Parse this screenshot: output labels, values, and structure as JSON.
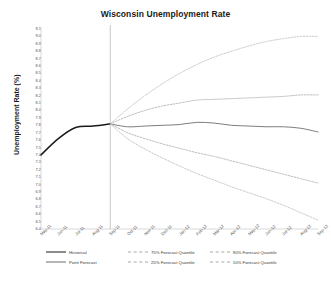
{
  "chart_data": {
    "type": "line",
    "title": "Wisconsin Unemployment Rate",
    "xlabel": "",
    "ylabel": "Unemployment Rate (%)",
    "ylim": [
      6.4,
      9.1
    ],
    "ytick_step": 0.1,
    "grid": false,
    "legend_position": "bottom",
    "x": [
      "May-11",
      "Jun-11",
      "Jul-11",
      "Aug-11",
      "Sep-11",
      "Oct-11",
      "Nov-11",
      "Dec-11",
      "Jan-12",
      "Feb-12",
      "Mar-12",
      "Apr-12",
      "May-12",
      "Jun-12",
      "Jul-12",
      "Aug-12",
      "Sep-12"
    ],
    "yticks": [
      "9.1",
      "9.0",
      "8.9",
      "8.8",
      "8.7",
      "8.6",
      "8.5",
      "8.4",
      "8.3",
      "8.2",
      "8.1",
      "8.0",
      "7.9",
      "7.8",
      "7.7",
      "7.6",
      "7.5",
      "7.4",
      "7.3",
      "7.2",
      "7.1",
      "7.0",
      "6.9",
      "6.8",
      "6.7",
      "6.6",
      "6.5",
      "6.4"
    ],
    "forecast_start": "Sep-11",
    "annotations": [
      {
        "name": "forecast-divider",
        "x": "Sep-11",
        "style": "vertical-line"
      }
    ],
    "series": [
      {
        "name": "Historical",
        "style": "solid",
        "color": "#1a1a1a",
        "values": [
          7.4,
          7.62,
          7.77,
          7.79,
          7.82,
          null,
          null,
          null,
          null,
          null,
          null,
          null,
          null,
          null,
          null,
          null,
          null
        ]
      },
      {
        "name": "Point Forecast",
        "style": "solid",
        "color": "#6e6e6e",
        "values": [
          null,
          null,
          null,
          null,
          7.82,
          7.78,
          7.79,
          7.8,
          7.81,
          7.84,
          7.83,
          7.8,
          7.79,
          7.78,
          7.78,
          7.76,
          7.71
        ]
      },
      {
        "name": "75% Forecast Quantile",
        "style": "dashed",
        "color": "#a8a8a8",
        "values": [
          null,
          null,
          null,
          null,
          7.82,
          7.92,
          8.0,
          8.06,
          8.1,
          8.14,
          8.15,
          8.16,
          8.17,
          8.18,
          8.19,
          8.21,
          8.21
        ]
      },
      {
        "name": "90% Forecast Quantile",
        "style": "dashed",
        "color": "#bdbdbd",
        "values": [
          null,
          null,
          null,
          null,
          7.82,
          8.02,
          8.2,
          8.36,
          8.5,
          8.62,
          8.72,
          8.8,
          8.87,
          8.93,
          8.97,
          9.0,
          9.0
        ]
      },
      {
        "name": "25% Forecast Quantile",
        "style": "dashed",
        "color": "#a8a8a8",
        "values": [
          null,
          null,
          null,
          null,
          7.82,
          7.7,
          7.62,
          7.55,
          7.49,
          7.43,
          7.38,
          7.32,
          7.26,
          7.2,
          7.14,
          7.08,
          7.02
        ]
      },
      {
        "name": "10% Forecast Quantile",
        "style": "dashed",
        "color": "#bdbdbd",
        "values": [
          null,
          null,
          null,
          null,
          7.82,
          7.62,
          7.48,
          7.36,
          7.25,
          7.15,
          7.06,
          6.97,
          6.89,
          6.81,
          6.72,
          6.62,
          6.52
        ]
      }
    ]
  },
  "legend": {
    "items": [
      {
        "label": "Historical",
        "swatch": "sw-solid-dark"
      },
      {
        "label": "75% Forecast Quantile",
        "swatch": "sw-dash"
      },
      {
        "label": "90% Forecast Quantile",
        "swatch": "sw-dash"
      },
      {
        "label": "Point Forecast",
        "swatch": "sw-solid-gray"
      },
      {
        "label": "25% Forecast Quantile",
        "swatch": "sw-dash"
      },
      {
        "label": "10% Forecast Quantile",
        "swatch": "sw-dash"
      }
    ]
  },
  "colors": {
    "historical": "#1a1a1a",
    "point_forecast": "#6e6e6e",
    "quantile_inner": "#a8a8a8",
    "quantile_outer": "#bdbdbd",
    "axis": "#c8c8c8",
    "text": "#4d4d4d"
  }
}
